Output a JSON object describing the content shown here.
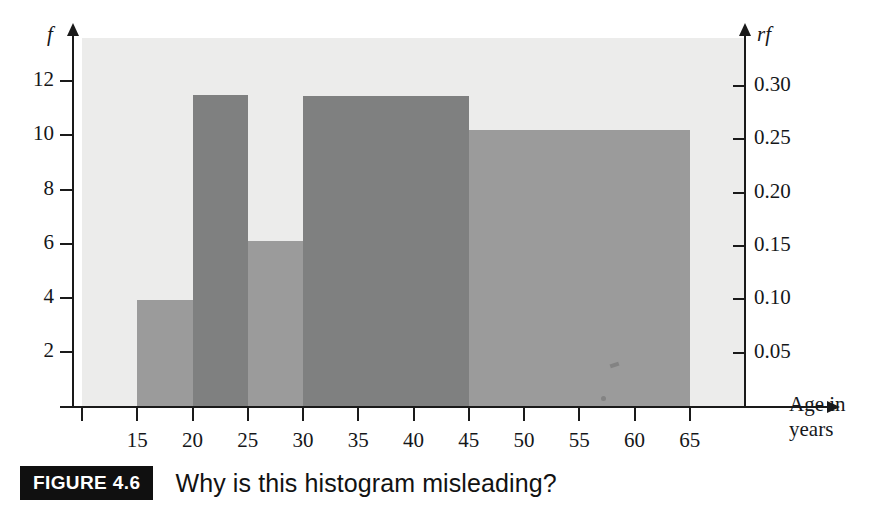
{
  "figure": {
    "badge": "FIGURE 4.6",
    "caption": "Why is this histogram misleading?"
  },
  "colors": {
    "plot_background": "#ececeb",
    "bar_dark": "#7f8080",
    "bar_light": "#9b9b9b",
    "axis": "#1a1a1a",
    "text": "#15171a",
    "badge_background": "#101010",
    "badge_text": "#ffffff"
  },
  "chart_data": {
    "type": "bar",
    "title": "",
    "subtitle": "",
    "xlabel": "Age in years",
    "ylabel": "f",
    "ylabel_secondary": "rf",
    "xlim": [
      10,
      70
    ],
    "ylim": [
      0,
      13.6
    ],
    "ylim_secondary": [
      0,
      0.3448
    ],
    "grid": false,
    "legend": null,
    "xticks": [
      15,
      20,
      25,
      30,
      35,
      40,
      45,
      50,
      55,
      60,
      65
    ],
    "xticklabels": [
      "15",
      "20",
      "25",
      "30",
      "35",
      "40",
      "45",
      "50",
      "55",
      "60",
      "65"
    ],
    "yticks": [
      2,
      4,
      6,
      8,
      10,
      12
    ],
    "yticklabels": [
      "2",
      "4",
      "6",
      "8",
      "10",
      "12"
    ],
    "yticks_secondary": [
      0.05,
      0.1,
      0.15,
      0.2,
      0.25,
      0.3
    ],
    "yticklabels_secondary": [
      "0.05",
      "0.10",
      "0.15",
      "0.20",
      "0.25",
      "0.30"
    ],
    "bins": [
      {
        "label": "15-20",
        "x_start": 15,
        "x_end": 20,
        "frequency": 3.9,
        "relative_frequency": 0.1,
        "shade": "light"
      },
      {
        "label": "20-25",
        "x_start": 20,
        "x_end": 25,
        "frequency": 11.5,
        "relative_frequency": 0.3,
        "shade": "dark"
      },
      {
        "label": "25-30",
        "x_start": 25,
        "x_end": 30,
        "frequency": 6.1,
        "relative_frequency": 0.155,
        "shade": "light"
      },
      {
        "label": "30-45",
        "x_start": 30,
        "x_end": 45,
        "frequency": 11.45,
        "relative_frequency": 0.295,
        "shade": "dark"
      },
      {
        "label": "45-65",
        "x_start": 45,
        "x_end": 65,
        "frequency": 10.2,
        "relative_frequency": 0.26,
        "shade": "light"
      }
    ]
  }
}
